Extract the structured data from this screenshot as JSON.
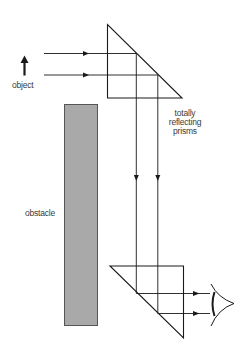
{
  "diagram": {
    "type": "periscope-optics",
    "labels": {
      "object": "object",
      "prisms_line1": "totally",
      "prisms_line2": "reflecting",
      "prisms_line3": "prisms",
      "obstacle": "obstacle"
    },
    "colors": {
      "line": "#1a1a1a",
      "obstacle_fill": "#a9a9a9",
      "obstacle_border": "#555555",
      "text": "#3a3a3a",
      "background": "#ffffff"
    },
    "elements": {
      "object_arrow": "upward arrow representing the object",
      "top_prism": "right-angle prism reflecting rays downward",
      "bottom_prism": "right-angle prism reflecting rays toward the eye",
      "obstacle": "grey rectangular obstacle",
      "eye": "observer eye"
    }
  }
}
